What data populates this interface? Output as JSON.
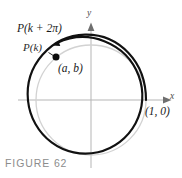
{
  "figure": {
    "caption": "FIGURE 62",
    "background_color": "#ffffff",
    "width": 182,
    "height": 178
  },
  "axes": {
    "x_label": "x",
    "y_label": "y",
    "axis_color": "#b3b3b3",
    "arrow_color": "#6b6b6b",
    "origin": {
      "x": 91,
      "y": 100
    },
    "x_min": 18,
    "x_max": 172,
    "y_top": 22,
    "y_bottom": 168
  },
  "circle": {
    "name": "unit-circle",
    "center_x": 91,
    "center_y": 100,
    "radius": 55,
    "stroke_color": "#cccccc",
    "stroke_width": 1.2
  },
  "spiral": {
    "name": "wrapping-arc",
    "stroke_color": "#111111",
    "stroke_width": 2.1,
    "start_angle_deg": 0,
    "end_angle_deg": 390,
    "start_radius": 55,
    "end_radius": 61,
    "description": "counterclockwise arc from (1,0) through more than one full revolution"
  },
  "points": [
    {
      "name": "point-p-k",
      "label": "P(k)",
      "coordinate_label": "(a, b)",
      "x": 56,
      "y": 57,
      "dot_radius": 3.4,
      "dot_color": "#0d0d0d"
    },
    {
      "name": "point-1-0",
      "label": "(1, 0)",
      "x": 146,
      "y": 100
    }
  ],
  "labels": {
    "p_k_plus_2pi": "P(k + 2π)",
    "p_k": "P(k)",
    "a_b": "(a, b)",
    "one_zero": "(1, 0)",
    "axis_x": "x",
    "axis_y": "y"
  }
}
